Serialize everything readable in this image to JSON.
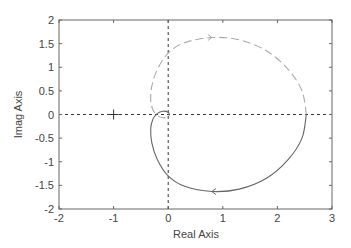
{
  "chart_data": {
    "type": "line",
    "title": "",
    "xlabel": "Real Axis",
    "ylabel": "Imag Axis",
    "xlim": [
      -2,
      3
    ],
    "ylim": [
      -2,
      2
    ],
    "xticks": [
      -2,
      -1,
      0,
      1,
      2,
      3
    ],
    "xtick_labels": [
      "-2",
      "-1",
      "0",
      "1",
      "2",
      "3"
    ],
    "yticks": [
      2,
      1.5,
      1,
      0.5,
      0,
      -0.5,
      -1,
      -1.5,
      -2
    ],
    "ytick_labels": [
      "2",
      "1.5",
      "1",
      "0.5",
      "0",
      "-0.5",
      "-1",
      "-1.5",
      "-2"
    ],
    "grid": false,
    "legend": null,
    "annotations": [
      {
        "type": "marker",
        "symbol": "+",
        "x": -1,
        "y": 0,
        "label": "critical point"
      }
    ],
    "series": [
      {
        "name": "positive frequencies",
        "style": "solid",
        "color": "#666666",
        "direction_arrow": {
          "x": 0.8,
          "y": -1.63
        },
        "points": [
          [
            0.02,
            0.0
          ],
          [
            0.0,
            0.05
          ],
          [
            -0.1,
            0.07
          ],
          [
            -0.2,
            0.02
          ],
          [
            -0.28,
            -0.1
          ],
          [
            -0.32,
            -0.3
          ],
          [
            -0.3,
            -0.6
          ],
          [
            -0.2,
            -0.95
          ],
          [
            0.0,
            -1.3
          ],
          [
            0.3,
            -1.52
          ],
          [
            0.8,
            -1.63
          ],
          [
            1.3,
            -1.58
          ],
          [
            1.8,
            -1.35
          ],
          [
            2.2,
            -0.95
          ],
          [
            2.45,
            -0.5
          ],
          [
            2.53,
            0.0
          ]
        ]
      },
      {
        "name": "negative frequencies",
        "style": "dashed",
        "color": "#aaaaaa",
        "direction_arrow": {
          "x": 0.8,
          "y": 1.63
        },
        "points": [
          [
            2.53,
            0.0
          ],
          [
            2.45,
            0.5
          ],
          [
            2.2,
            0.95
          ],
          [
            1.8,
            1.35
          ],
          [
            1.3,
            1.58
          ],
          [
            0.8,
            1.63
          ],
          [
            0.3,
            1.52
          ],
          [
            0.0,
            1.3
          ],
          [
            -0.2,
            0.95
          ],
          [
            -0.3,
            0.6
          ],
          [
            -0.32,
            0.3
          ],
          [
            -0.28,
            0.1
          ],
          [
            -0.2,
            -0.02
          ],
          [
            -0.1,
            -0.07
          ],
          [
            0.0,
            -0.05
          ],
          [
            0.02,
            0.0
          ]
        ]
      }
    ],
    "reference_lines": [
      {
        "orientation": "horizontal",
        "value": 0,
        "style": "dotted"
      },
      {
        "orientation": "vertical",
        "value": 0,
        "style": "dotted"
      }
    ]
  },
  "labels": {
    "xlabel": "Real Axis",
    "ylabel": "Imag Axis",
    "xticks": [
      "-2",
      "-1",
      "0",
      "1",
      "2",
      "3"
    ],
    "yticks": [
      "2",
      "1.5",
      "1",
      "0.5",
      "0",
      "-0.5",
      "-1",
      "-1.5",
      "-2"
    ]
  }
}
